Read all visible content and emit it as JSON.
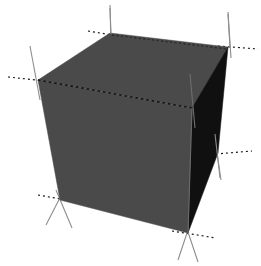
{
  "figure": {
    "title": "",
    "background_color": "#ffffff",
    "width": 261,
    "height": 266,
    "alt_text": "Shaded 3D cube with axis tick marks at its vertices"
  },
  "chart_data": {
    "type": "scatter",
    "plot_kind": "3d-cube-wireframe-shaded",
    "title": "",
    "xlabel": "",
    "ylabel": "",
    "zlabel": "",
    "grid": false,
    "legend": false,
    "colors": {
      "top_face": "#4a4a4a",
      "front_face": "#4a4a4a",
      "right_face": "#101010",
      "edge_solid": "#8d8d8d",
      "edge_dotted": "#1a1a1a",
      "background": "#ffffff"
    },
    "projection": {
      "type": "perspective",
      "elevation_deg": 22,
      "azimuth_deg": -52
    },
    "vertices_2d": {
      "top_back_left": [
        110,
        33
      ],
      "top_back_right": [
        228,
        47
      ],
      "top_front_left": [
        38,
        80
      ],
      "top_front_right": [
        192,
        108
      ],
      "bottom_front_left": [
        60,
        200
      ],
      "bottom_front_right": [
        188,
        233
      ],
      "bottom_back_right": [
        218,
        153
      ],
      "bottom_back_left_hidden": [
        128,
        140
      ]
    },
    "faces": [
      {
        "name": "top",
        "vertex_keys": [
          "top_back_left",
          "top_back_right",
          "top_front_right",
          "top_front_left"
        ],
        "fill": "#4a4a4a"
      },
      {
        "name": "front-left",
        "vertex_keys": [
          "top_front_left",
          "top_front_right",
          "bottom_front_right",
          "bottom_front_left"
        ],
        "fill": "#4a4a4a"
      },
      {
        "name": "right",
        "vertex_keys": [
          "top_front_right",
          "top_back_right",
          "bottom_back_right",
          "bottom_front_right"
        ],
        "fill": "#101010"
      }
    ],
    "edges": [
      {
        "name": "top-back-left-to-top-back-right",
        "style": "solid",
        "visible": true
      },
      {
        "name": "top-back-right-to-top-front-right",
        "style": "solid",
        "visible": true
      },
      {
        "name": "top-front-right-to-top-front-left",
        "style": "dotted",
        "visible": true
      },
      {
        "name": "top-front-left-to-top-back-left",
        "style": "solid",
        "visible": true
      },
      {
        "name": "top-front-left-to-bottom-front-left",
        "style": "solid",
        "visible": true
      },
      {
        "name": "top-front-right-to-bottom-front-right",
        "style": "solid",
        "visible": true
      },
      {
        "name": "top-back-right-to-bottom-back-right",
        "style": "solid",
        "visible": true
      },
      {
        "name": "bottom-front-left-to-bottom-front-right",
        "style": "solid",
        "visible": true
      },
      {
        "name": "bottom-front-right-to-bottom-back-right",
        "style": "solid",
        "visible": true
      }
    ],
    "tick_marks": [
      {
        "axis": "z",
        "at_vertex": "top_back_left",
        "style": "solid",
        "color": "#8d8d8d"
      },
      {
        "axis": "y",
        "at_vertex": "top_back_left",
        "style": "dotted",
        "color": "#1a1a1a"
      },
      {
        "axis": "z",
        "at_vertex": "top_back_right",
        "style": "solid",
        "color": "#8d8d8d"
      },
      {
        "axis": "y",
        "at_vertex": "top_back_right",
        "style": "dotted",
        "color": "#1a1a1a"
      },
      {
        "axis": "z",
        "at_vertex": "top_front_left",
        "style": "solid",
        "color": "#8d8d8d"
      },
      {
        "axis": "x",
        "at_vertex": "top_front_left",
        "style": "dotted",
        "color": "#1a1a1a"
      },
      {
        "axis": "z",
        "at_vertex": "top_front_right",
        "style": "solid",
        "color": "#8d8d8d"
      },
      {
        "axis": "x",
        "at_vertex": "bottom_back_right",
        "style": "dotted",
        "color": "#1a1a1a"
      },
      {
        "axis": "z",
        "at_vertex": "bottom_back_right",
        "style": "solid",
        "color": "#8d8d8d"
      },
      {
        "axis": "x",
        "at_vertex": "bottom_front_left",
        "style": "dotted",
        "color": "#1a1a1a"
      },
      {
        "axis": "y",
        "at_vertex": "bottom_front_left",
        "style": "solid",
        "color": "#8d8d8d"
      },
      {
        "axis": "x",
        "at_vertex": "bottom_front_right",
        "style": "dotted",
        "color": "#1a1a1a"
      },
      {
        "axis": "y",
        "at_vertex": "bottom_front_right",
        "style": "solid",
        "color": "#8d8d8d"
      }
    ],
    "tick_labels": [],
    "annotations": []
  }
}
